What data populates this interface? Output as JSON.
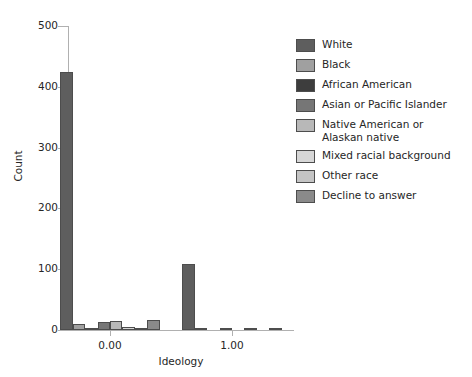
{
  "chart_data": {
    "type": "bar",
    "title": "",
    "xlabel": "Ideology",
    "ylabel": "Count",
    "ylim": [
      0,
      500
    ],
    "yticks": [
      0,
      100,
      200,
      300,
      400,
      500
    ],
    "ytick_labels": [
      "0",
      "100",
      "200",
      "300",
      "400",
      "500"
    ],
    "xtick_positions": [
      0.0,
      1.0
    ],
    "xtick_labels": [
      "0.00",
      "1.00"
    ],
    "grid": false,
    "legend_position": "right",
    "categories": [
      "0.00",
      "1.00"
    ],
    "series": [
      {
        "name": "White",
        "color": "#5e5e5e",
        "values": [
          425,
          108
        ]
      },
      {
        "name": "Black",
        "color": "#a0a0a0",
        "values": [
          10,
          1
        ]
      },
      {
        "name": "African American",
        "color": "#3d3d3d",
        "values": [
          2,
          0
        ]
      },
      {
        "name": "Asian or Pacific Islander",
        "color": "#767676",
        "values": [
          14,
          2
        ]
      },
      {
        "name": "Native American or\nAlaskan native",
        "color": "#b8b8b8",
        "values": [
          15,
          0
        ]
      },
      {
        "name": "Mixed racial background",
        "color": "#d6d6d6",
        "values": [
          5,
          1
        ]
      },
      {
        "name": "Other race",
        "color": "#c4c4c4",
        "values": [
          2,
          0
        ]
      },
      {
        "name": "Decline to answer",
        "color": "#8a8a8a",
        "values": [
          16,
          2
        ]
      }
    ]
  },
  "legend": {
    "items": [
      {
        "label": "White",
        "label2": "",
        "color": "#5e5e5e"
      },
      {
        "label": "Black",
        "label2": "",
        "color": "#a0a0a0"
      },
      {
        "label": "African American",
        "label2": "",
        "color": "#3d3d3d"
      },
      {
        "label": "Asian or Pacific Islander",
        "label2": "",
        "color": "#767676"
      },
      {
        "label": "Native American or",
        "label2": "Alaskan native",
        "color": "#b8b8b8"
      },
      {
        "label": "Mixed racial background",
        "label2": "",
        "color": "#d6d6d6"
      },
      {
        "label": "Other race",
        "label2": "",
        "color": "#c4c4c4"
      },
      {
        "label": "Decline to answer",
        "label2": "",
        "color": "#8a8a8a"
      }
    ]
  },
  "axes": {
    "y_title": "Count",
    "x_title": "Ideology"
  },
  "style": {
    "spine_color": "#b0b0b0",
    "bar_edge_color": "#4d4d4d",
    "text_color": "#262626",
    "background": "#ffffff"
  }
}
